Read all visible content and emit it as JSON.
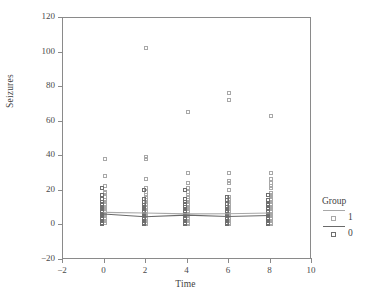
{
  "chart_data": {
    "type": "scatter",
    "title": "",
    "xlabel": "Time",
    "ylabel": "Seizures",
    "xlim": [
      -2,
      10
    ],
    "ylim": [
      -20,
      120
    ],
    "xticks": [
      -2,
      0,
      2,
      4,
      6,
      8,
      10
    ],
    "yticks": [
      -20,
      0,
      20,
      40,
      60,
      80,
      100,
      120
    ],
    "grid": false,
    "legend": {
      "title": "Group",
      "position": "right",
      "entries": [
        {
          "label": "1",
          "marker": "open-square",
          "color": "#a8a8a8",
          "line_color": "#a8a8a8"
        },
        {
          "label": "0",
          "marker": "open-square",
          "color": "#6e6e6e",
          "line_color": "#6a6a6a"
        }
      ]
    },
    "series": [
      {
        "name": "1",
        "color": "#a8a8a8",
        "points": [
          [
            0,
            38
          ],
          [
            0,
            28
          ],
          [
            0,
            22
          ],
          [
            0,
            19
          ],
          [
            0,
            18
          ],
          [
            0,
            16
          ],
          [
            0,
            14
          ],
          [
            0,
            13
          ],
          [
            0,
            12
          ],
          [
            0,
            11
          ],
          [
            0,
            10
          ],
          [
            0,
            9
          ],
          [
            0,
            8
          ],
          [
            0,
            7
          ],
          [
            0,
            6
          ],
          [
            0,
            5
          ],
          [
            0,
            4
          ],
          [
            0,
            3
          ],
          [
            0,
            2
          ],
          [
            0,
            1
          ],
          [
            2,
            102
          ],
          [
            2,
            39
          ],
          [
            2,
            38
          ],
          [
            2,
            26
          ],
          [
            2,
            21
          ],
          [
            2,
            19
          ],
          [
            2,
            17
          ],
          [
            2,
            16
          ],
          [
            2,
            14
          ],
          [
            2,
            13
          ],
          [
            2,
            12
          ],
          [
            2,
            11
          ],
          [
            2,
            10
          ],
          [
            2,
            8
          ],
          [
            2,
            7
          ],
          [
            2,
            6
          ],
          [
            2,
            5
          ],
          [
            2,
            4
          ],
          [
            2,
            3
          ],
          [
            2,
            2
          ],
          [
            2,
            1
          ],
          [
            2,
            0
          ],
          [
            4,
            65
          ],
          [
            4,
            30
          ],
          [
            4,
            24
          ],
          [
            4,
            21
          ],
          [
            4,
            19
          ],
          [
            4,
            17
          ],
          [
            4,
            16
          ],
          [
            4,
            14
          ],
          [
            4,
            13
          ],
          [
            4,
            12
          ],
          [
            4,
            11
          ],
          [
            4,
            10
          ],
          [
            4,
            9
          ],
          [
            4,
            8
          ],
          [
            4,
            7
          ],
          [
            4,
            6
          ],
          [
            4,
            5
          ],
          [
            4,
            4
          ],
          [
            4,
            3
          ],
          [
            4,
            2
          ],
          [
            4,
            1
          ],
          [
            4,
            0
          ],
          [
            6,
            76
          ],
          [
            6,
            72
          ],
          [
            6,
            30
          ],
          [
            6,
            25
          ],
          [
            6,
            24
          ],
          [
            6,
            20
          ],
          [
            6,
            16
          ],
          [
            6,
            15
          ],
          [
            6,
            14
          ],
          [
            6,
            13
          ],
          [
            6,
            12
          ],
          [
            6,
            11
          ],
          [
            6,
            10
          ],
          [
            6,
            9
          ],
          [
            6,
            8
          ],
          [
            6,
            7
          ],
          [
            6,
            6
          ],
          [
            6,
            5
          ],
          [
            6,
            4
          ],
          [
            6,
            3
          ],
          [
            6,
            2
          ],
          [
            6,
            1
          ],
          [
            6,
            0
          ],
          [
            8,
            63
          ],
          [
            8,
            30
          ],
          [
            8,
            26
          ],
          [
            8,
            24
          ],
          [
            8,
            22
          ],
          [
            8,
            21
          ],
          [
            8,
            18
          ],
          [
            8,
            17
          ],
          [
            8,
            16
          ],
          [
            8,
            15
          ],
          [
            8,
            14
          ],
          [
            8,
            13
          ],
          [
            8,
            12
          ],
          [
            8,
            11
          ],
          [
            8,
            10
          ],
          [
            8,
            9
          ],
          [
            8,
            8
          ],
          [
            8,
            7
          ],
          [
            8,
            6
          ],
          [
            8,
            5
          ],
          [
            8,
            4
          ],
          [
            8,
            3
          ],
          [
            8,
            2
          ],
          [
            8,
            1
          ],
          [
            8,
            0
          ]
        ],
        "trend": [
          [
            0,
            7.0
          ],
          [
            2,
            6.6
          ],
          [
            4,
            6.1
          ],
          [
            6,
            6.2
          ],
          [
            8,
            6.6
          ]
        ]
      },
      {
        "name": "0",
        "color": "#6e6e6e",
        "points": [
          [
            0,
            21
          ],
          [
            0,
            17
          ],
          [
            0,
            15
          ],
          [
            0,
            13
          ],
          [
            0,
            12
          ],
          [
            0,
            11
          ],
          [
            0,
            10
          ],
          [
            0,
            9
          ],
          [
            0,
            8
          ],
          [
            0,
            7
          ],
          [
            0,
            6
          ],
          [
            0,
            5
          ],
          [
            0,
            4
          ],
          [
            0,
            3
          ],
          [
            0,
            2
          ],
          [
            0,
            1
          ],
          [
            0,
            0
          ],
          [
            2,
            20
          ],
          [
            2,
            15
          ],
          [
            2,
            13
          ],
          [
            2,
            11
          ],
          [
            2,
            10
          ],
          [
            2,
            9
          ],
          [
            2,
            8
          ],
          [
            2,
            7
          ],
          [
            2,
            6
          ],
          [
            2,
            5
          ],
          [
            2,
            4
          ],
          [
            2,
            3
          ],
          [
            2,
            2
          ],
          [
            2,
            1
          ],
          [
            2,
            0
          ],
          [
            4,
            20
          ],
          [
            4,
            15
          ],
          [
            4,
            13
          ],
          [
            4,
            12
          ],
          [
            4,
            10
          ],
          [
            4,
            9
          ],
          [
            4,
            8
          ],
          [
            4,
            7
          ],
          [
            4,
            6
          ],
          [
            4,
            5
          ],
          [
            4,
            4
          ],
          [
            4,
            3
          ],
          [
            4,
            2
          ],
          [
            4,
            1
          ],
          [
            4,
            0
          ],
          [
            6,
            16
          ],
          [
            6,
            14
          ],
          [
            6,
            12
          ],
          [
            6,
            10
          ],
          [
            6,
            9
          ],
          [
            6,
            8
          ],
          [
            6,
            7
          ],
          [
            6,
            6
          ],
          [
            6,
            5
          ],
          [
            6,
            4
          ],
          [
            6,
            3
          ],
          [
            6,
            2
          ],
          [
            6,
            1
          ],
          [
            6,
            0
          ],
          [
            8,
            17
          ],
          [
            8,
            14
          ],
          [
            8,
            12
          ],
          [
            8,
            11
          ],
          [
            8,
            9
          ],
          [
            8,
            8
          ],
          [
            8,
            7
          ],
          [
            8,
            6
          ],
          [
            8,
            5
          ],
          [
            8,
            4
          ],
          [
            8,
            3
          ],
          [
            8,
            2
          ],
          [
            8,
            1
          ],
          [
            8,
            0
          ]
        ],
        "trend": [
          [
            0,
            6.0
          ],
          [
            2,
            4.4
          ],
          [
            4,
            5.4
          ],
          [
            6,
            4.6
          ],
          [
            8,
            5.2
          ]
        ]
      }
    ]
  }
}
